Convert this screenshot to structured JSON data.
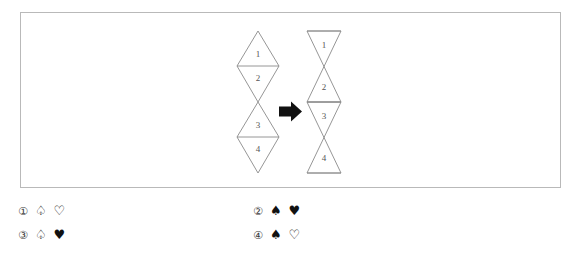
{
  "panel": {
    "name": "figure-sequence-panel",
    "border_color": "#b9b9b9",
    "background": "#ffffff"
  },
  "figure_left": {
    "name": "two-stacked-diamonds",
    "description": "Two rhombi stacked vertically, touching at a single point; each rhombus split by a horizontal line into an upper and lower triangle.",
    "cell_labels": [
      "1",
      "2",
      "3",
      "4"
    ],
    "stroke_color": "#8a8a8a"
  },
  "figure_right": {
    "name": "two-stacked-bowties",
    "description": "Two bowtie/hourglass shapes stacked vertically, touching at a single point; each bowtie split by a horizontal line into an upper and lower triangle.",
    "cell_labels": [
      "1",
      "2",
      "3",
      "4"
    ],
    "stroke_color": "#8a8a8a"
  },
  "arrow": {
    "name": "transformation-arrow",
    "direction": "right",
    "glyph": "➡",
    "color": "#111111"
  },
  "options": [
    {
      "index": "①",
      "suits": [
        "♤",
        "♡"
      ],
      "suit_names": [
        "spade-outline-icon",
        "heart-outline-icon"
      ],
      "column": "left",
      "row": 1
    },
    {
      "index": "②",
      "suits": [
        "♠",
        "♥"
      ],
      "suit_names": [
        "spade-filled-icon",
        "heart-filled-icon"
      ],
      "column": "right",
      "row": 1
    },
    {
      "index": "③",
      "suits": [
        "♤",
        "♥"
      ],
      "suit_names": [
        "spade-outline-icon",
        "heart-filled-icon"
      ],
      "column": "left",
      "row": 2
    },
    {
      "index": "④",
      "suits": [
        "♠",
        "♡"
      ],
      "suit_names": [
        "spade-filled-icon",
        "heart-outline-icon"
      ],
      "column": "right",
      "row": 2
    }
  ]
}
